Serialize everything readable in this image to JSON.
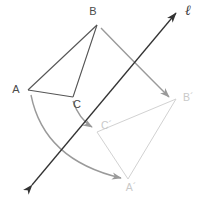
{
  "figure": {
    "background_color": "#ffffff",
    "width": 206,
    "height": 204
  },
  "colors": {
    "preimage_stroke": "#555555",
    "image_stroke": "#d2d2d2",
    "mapping_arrow": "#9a9a9a",
    "mirror_line": "#333333",
    "preimage_label": "#4a4a4a",
    "image_label": "#c9c9c9"
  },
  "mirror_line": {
    "name": "l",
    "label": "ℓ",
    "label_x": 188,
    "label_y": 15,
    "x1": 32,
    "y1": 185,
    "x2": 176,
    "y2": 13,
    "arrow_start": true,
    "arrow_end": true,
    "stroke_width": 1.3
  },
  "preimage": {
    "name": "triangle-abc",
    "stroke_width": 1.1,
    "fill": "none",
    "vertices": [
      {
        "name": "A",
        "x": 28,
        "y": 90,
        "label": "A",
        "label_x": 16,
        "label_y": 93
      },
      {
        "name": "B",
        "x": 97,
        "y": 25,
        "label": "B",
        "label_x": 93,
        "label_y": 15
      },
      {
        "name": "C",
        "x": 73,
        "y": 97,
        "label": "C",
        "label_x": 77,
        "label_y": 108
      }
    ],
    "edges": [
      {
        "name": "edge-ab",
        "from": "A",
        "to": "B"
      },
      {
        "name": "edge-bc",
        "from": "B",
        "to": "C"
      },
      {
        "name": "edge-ca",
        "from": "C",
        "to": "A"
      }
    ]
  },
  "image": {
    "name": "triangle-a-prime-b-prime-c-prime",
    "stroke_width": 1.0,
    "fill": "none",
    "vertices": [
      {
        "name": "A'",
        "x": 128,
        "y": 179,
        "label": "A´",
        "label_x": 131,
        "label_y": 191
      },
      {
        "name": "B'",
        "x": 176,
        "y": 99,
        "label": "B´",
        "label_x": 183,
        "label_y": 101
      },
      {
        "name": "C'",
        "x": 97,
        "y": 132,
        "label": "C´",
        "label_x": 101,
        "label_y": 129
      }
    ],
    "edges": [
      {
        "name": "edge-a-prime-b-prime",
        "from": "A'",
        "to": "B'"
      },
      {
        "name": "edge-b-prime-c-prime",
        "from": "B'",
        "to": "C'"
      },
      {
        "name": "edge-c-prime-a-prime",
        "from": "C'",
        "to": "A'"
      }
    ]
  },
  "mapping_arrows": [
    {
      "name": "arc-a-to-a-prime",
      "from": "A",
      "to": "A'",
      "path": "M 31 95 Q 44 160 121 178",
      "stroke_width": 1.4
    },
    {
      "name": "arc-b-to-b-prime",
      "from": "B",
      "to": "B'",
      "path": "M 101 28 Q 130 58 169 97",
      "stroke_width": 1.4
    },
    {
      "name": "arc-c-to-c-prime",
      "from": "C",
      "to": "C'",
      "path": "M 73 101 Q 79 119 92 127",
      "stroke_width": 1.4
    }
  ],
  "legend": {
    "preimage_caption": "",
    "image_caption": ""
  }
}
